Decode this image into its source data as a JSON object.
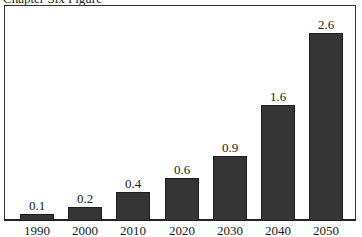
{
  "caption": "Chapter Six Figure",
  "chart_data": {
    "type": "bar",
    "title": "",
    "xlabel": "",
    "ylabel": "",
    "categories": [
      "1990",
      "2000",
      "2010",
      "2020",
      "2030",
      "2040",
      "2050"
    ],
    "values": [
      0.1,
      0.2,
      0.4,
      0.6,
      0.9,
      1.6,
      2.6
    ],
    "value_labels": [
      "0.1",
      "0.2",
      "0.4",
      "0.6",
      "0.9",
      "1.6",
      "2.6"
    ],
    "ylim": [
      0,
      2.6
    ],
    "grid": false,
    "legend": null,
    "bar_color": "#353535"
  }
}
